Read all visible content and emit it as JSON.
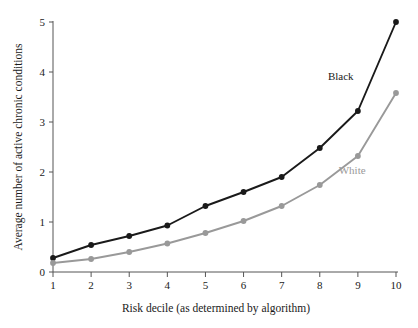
{
  "chart_data": {
    "type": "line",
    "title": "",
    "xlabel": "Risk decile (as determined by algorithm)",
    "ylabel": "Average number of active chronic conditions",
    "categories": [
      1,
      2,
      3,
      4,
      5,
      6,
      7,
      8,
      9,
      10
    ],
    "x": [
      1,
      2,
      3,
      4,
      5,
      6,
      7,
      8,
      9,
      10
    ],
    "xlim": [
      1,
      10
    ],
    "ylim": [
      0,
      5
    ],
    "xticks": [
      1,
      2,
      3,
      4,
      5,
      6,
      7,
      8,
      9,
      10
    ],
    "yticks": [
      0,
      1,
      2,
      3,
      4,
      5
    ],
    "xtick_labels": [
      "1",
      "2",
      "3",
      "4",
      "5",
      "6",
      "7",
      "8",
      "9",
      "10"
    ],
    "ytick_labels": [
      "0",
      "1",
      "2",
      "3",
      "4",
      "5"
    ],
    "grid": false,
    "legend_position": "inline-annotation",
    "series": [
      {
        "name": "Black",
        "color": "#1a1a1a",
        "marker": "circle",
        "values": [
          0.28,
          0.54,
          0.72,
          0.93,
          1.32,
          1.6,
          1.9,
          2.48,
          3.22,
          5.0
        ],
        "annotation": {
          "label": "Black",
          "x": 8.55,
          "y": 3.85
        }
      },
      {
        "name": "White",
        "color": "#999999",
        "marker": "circle",
        "values": [
          0.18,
          0.26,
          0.4,
          0.57,
          0.78,
          1.02,
          1.32,
          1.74,
          2.32,
          3.58
        ],
        "annotation": {
          "label": "White",
          "x": 8.85,
          "y": 1.96
        }
      }
    ]
  },
  "colors": {
    "background": "#ffffff",
    "axis": "#555555",
    "text": "#1a1a1a",
    "series_black": "#1a1a1a",
    "series_white": "#999999"
  }
}
